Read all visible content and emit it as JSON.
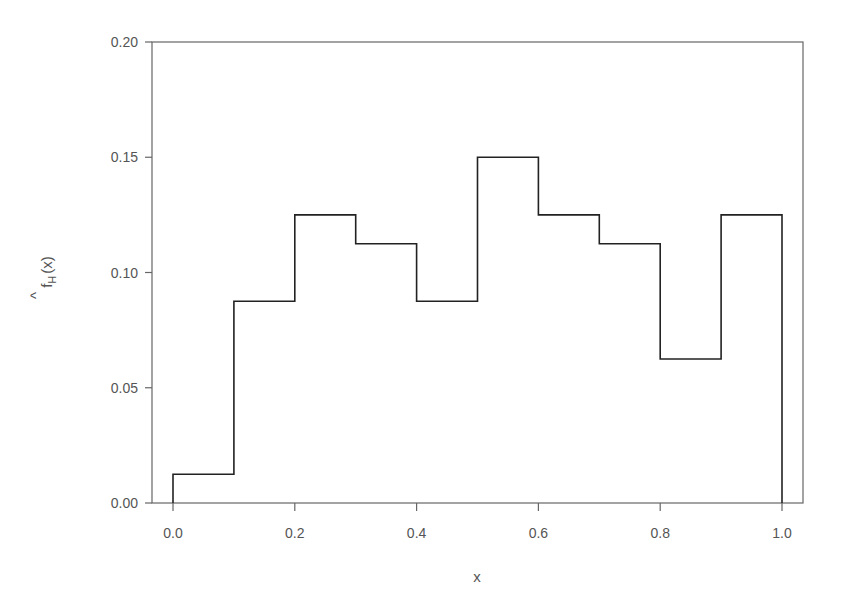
{
  "chart_data": {
    "type": "histogram",
    "title": "",
    "xlabel": "x",
    "ylabel": "f̂_H(x)",
    "ylabel_parts": {
      "main": "f",
      "sub": "H",
      "arg": "(x)"
    },
    "xlim": [
      0.0,
      1.0
    ],
    "ylim": [
      0.0,
      0.2
    ],
    "x_ticks": [
      0.0,
      0.2,
      0.4,
      0.6,
      0.8,
      1.0
    ],
    "x_tick_labels": [
      "0.0",
      "0.2",
      "0.4",
      "0.6",
      "0.8",
      "1.0"
    ],
    "y_ticks": [
      0.0,
      0.05,
      0.1,
      0.15,
      0.2
    ],
    "y_tick_labels": [
      "0.00",
      "0.05",
      "0.10",
      "0.15",
      "0.20"
    ],
    "grid": false,
    "legend": null,
    "bin_edges": [
      0.0,
      0.1,
      0.2,
      0.3,
      0.4,
      0.5,
      0.6,
      0.7,
      0.8,
      0.9,
      1.0
    ],
    "values": [
      0.0125,
      0.0875,
      0.125,
      0.1125,
      0.0875,
      0.15,
      0.125,
      0.1125,
      0.0625,
      0.125
    ],
    "line_color": "#222222",
    "frame_color": "#666666"
  }
}
